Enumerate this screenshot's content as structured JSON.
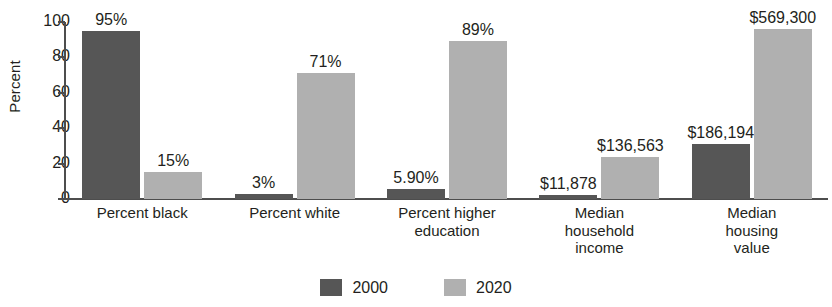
{
  "chart_data": {
    "type": "bar",
    "title": "",
    "subtitle": "",
    "xlabel": "",
    "ylabel": "Percent",
    "ylim": [
      0,
      100
    ],
    "yticks": [
      0,
      20,
      40,
      60,
      80,
      100
    ],
    "grid": false,
    "legend_position": "bottom-center",
    "categories": [
      "Percent black",
      "Percent white",
      "Percent higher education",
      "Median household income",
      "Median housing value"
    ],
    "category_lines": [
      [
        "Percent black"
      ],
      [
        "Percent white"
      ],
      [
        "Percent higher",
        "education"
      ],
      [
        "Median",
        "household",
        "income"
      ],
      [
        "Median",
        "housing",
        "value"
      ]
    ],
    "series": [
      {
        "name": "2000",
        "color": "#565656",
        "values": [
          95,
          3,
          5.9,
          2,
          31
        ],
        "labels": [
          "95%",
          "3%",
          "5.90%",
          "$11,878",
          "$186,194"
        ]
      },
      {
        "name": "2020",
        "color": "#b0b0b0",
        "values": [
          15,
          71,
          89,
          23.5,
          96
        ],
        "labels": [
          "15%",
          "71%",
          "89%",
          "$136,563",
          "$569,300"
        ]
      }
    ]
  },
  "legend": {
    "items": [
      {
        "label": "2000",
        "color": "#565656"
      },
      {
        "label": "2020",
        "color": "#b0b0b0"
      }
    ]
  },
  "axis": {
    "y_label": "Percent",
    "y_ticks": [
      "0",
      "20",
      "40",
      "60",
      "80",
      "100"
    ]
  }
}
